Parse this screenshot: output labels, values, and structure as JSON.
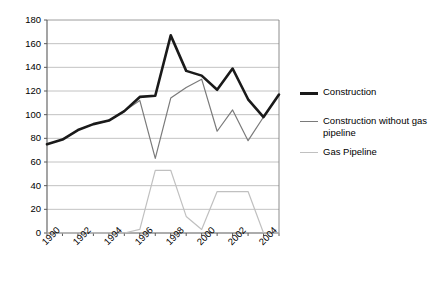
{
  "chart_data": {
    "type": "line",
    "title": "",
    "xlabel": "",
    "ylabel": "",
    "x": [
      1990,
      1991,
      1992,
      1993,
      1994,
      1995,
      1996,
      1997,
      1998,
      1999,
      2000,
      2001,
      2002,
      2003,
      2004,
      2005
    ],
    "xlim": [
      1990,
      2005
    ],
    "ylim": [
      0,
      180
    ],
    "yticks": [
      0,
      20,
      40,
      60,
      80,
      100,
      120,
      140,
      160,
      180
    ],
    "xticks": [
      1990,
      1992,
      1994,
      1996,
      1998,
      2000,
      2002,
      2004
    ],
    "xtick_labels": [
      "1990",
      "1992",
      "1994",
      "1996",
      "1998",
      "2000",
      "2002",
      "2004"
    ],
    "ytick_labels": [
      "0",
      "20",
      "40",
      "60",
      "80",
      "100",
      "120",
      "140",
      "160",
      "180"
    ],
    "grid": true,
    "grid_axis": "y",
    "legend_position": "right",
    "series": [
      {
        "name": "Construction",
        "color": "#1a1a1a",
        "width": 2.6,
        "values": [
          75,
          79,
          87,
          92,
          95,
          103,
          115,
          116,
          167,
          137,
          133,
          121,
          139,
          113,
          98,
          117
        ]
      },
      {
        "name": "Construction without gas pipeline",
        "color": "#7a7a7a",
        "width": 1.2,
        "values": [
          75,
          79,
          87,
          92,
          95,
          103,
          112,
          63,
          114,
          123,
          130,
          86,
          104,
          78,
          98,
          117
        ]
      },
      {
        "name": "Gas Pipeline",
        "color": "#c0c0c0",
        "width": 1.2,
        "values": [
          0,
          0,
          0,
          0,
          0,
          0,
          3,
          53,
          53,
          14,
          3,
          35,
          35,
          35,
          0,
          0
        ]
      }
    ]
  },
  "legend": {
    "items": [
      {
        "label": "Construction",
        "color": "#1a1a1a"
      },
      {
        "label": "Construction without gas\npipeline",
        "color": "#7a7a7a"
      },
      {
        "label": "Gas Pipeline",
        "color": "#c0c0c0"
      }
    ]
  },
  "axes": {
    "plot_left": 47,
    "plot_right": 279,
    "plot_top": 20,
    "plot_bottom": 233
  }
}
